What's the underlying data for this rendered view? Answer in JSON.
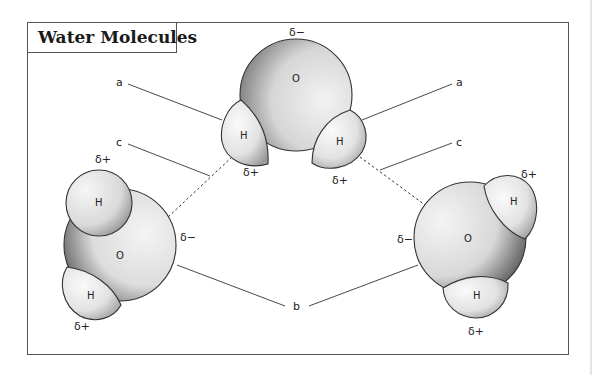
{
  "title": "Water Molecules",
  "labels": {
    "a_left": "a",
    "a_right": "a",
    "c_left": "c",
    "c_right": "c",
    "b": "b"
  },
  "molecules": {
    "top": {
      "oxygen": "O",
      "hydrogen_left": "H",
      "hydrogen_right": "H",
      "charge_oxygen": "δ−",
      "charge_h_left": "δ+",
      "charge_h_right": "δ+"
    },
    "left": {
      "oxygen": "O",
      "hydrogen_top": "H",
      "hydrogen_bottom": "H",
      "charge_oxygen": "δ−",
      "charge_h_top": "δ+",
      "charge_h_bottom": "δ+"
    },
    "right": {
      "oxygen": "O",
      "hydrogen_top": "H",
      "hydrogen_bottom": "H",
      "charge_oxygen": "δ−",
      "charge_h_top": "δ+",
      "charge_h_bottom": "δ+"
    }
  },
  "colors": {
    "frame": "#555555",
    "outline": "#333333",
    "fill_light": "#f4f4f4",
    "fill_dark": "#555555"
  }
}
